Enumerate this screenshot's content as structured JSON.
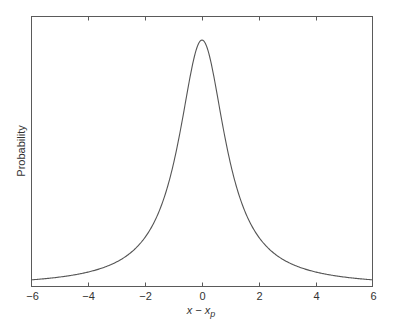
{
  "chart_data": {
    "type": "line",
    "title": "",
    "xlabel": "x − x",
    "xlabel_subscript": "p",
    "ylabel": "Probability",
    "xlim": [
      -6,
      6
    ],
    "ylim": [
      0,
      1.0
    ],
    "grid": false,
    "legend": null,
    "x_ticks": [
      -6,
      -4,
      -2,
      0,
      2,
      4,
      6
    ],
    "x_tick_labels": [
      "−6",
      "−4",
      "−2",
      "0",
      "2",
      "4",
      "6"
    ],
    "y_ticks": [],
    "series": [
      {
        "name": "Lorentzian probability profile",
        "function": "1 / (1 + (x/gamma)^2)",
        "gamma": 1.0,
        "x": [
          -6,
          -5,
          -4,
          -3,
          -2,
          -1.5,
          -1,
          -0.5,
          0,
          0.5,
          1,
          1.5,
          2,
          3,
          4,
          5,
          6
        ],
        "values": [
          0.027,
          0.038,
          0.059,
          0.1,
          0.2,
          0.308,
          0.5,
          0.8,
          1.0,
          0.8,
          0.5,
          0.308,
          0.2,
          0.1,
          0.059,
          0.038,
          0.027
        ]
      }
    ]
  }
}
